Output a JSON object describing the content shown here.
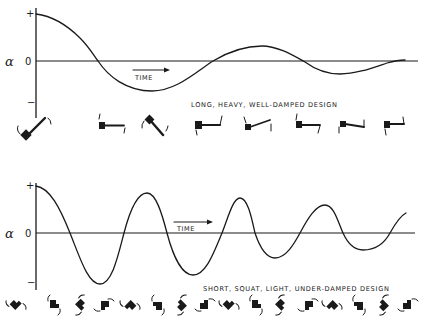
{
  "figure": {
    "panels": [
      {
        "id": "top",
        "y_axis_symbol": "α",
        "y_ticks": [
          "+",
          "0",
          "−"
        ],
        "x_label": "TIME",
        "caption": "LONG, HEAVY, WELL-DAMPED DESIGN",
        "response": "well-damped",
        "oscillation_description": "slow decaying oscillation, ~1.8 cycles visible",
        "pendulum_frame_count": 8,
        "pendulum_style": "long-arm"
      },
      {
        "id": "bottom",
        "y_axis_symbol": "α",
        "y_ticks": [
          "+",
          "0",
          "−"
        ],
        "x_label": "TIME",
        "caption": "SHORT, SQUAT, LIGHT, UNDER-DAMPED DESIGN",
        "response": "under-damped",
        "oscillation_description": "fast lightly decaying oscillation, ~4 cycles visible",
        "pendulum_frame_count": 16,
        "pendulum_style": "short-squat"
      }
    ]
  },
  "chart_data": [
    {
      "type": "line",
      "title": "LONG, HEAVY, WELL-DAMPED DESIGN",
      "xlabel": "TIME",
      "ylabel": "α",
      "y_ticks": [
        "+",
        "0",
        "−"
      ],
      "ylim": [
        -1,
        1
      ],
      "xlim": [
        0,
        1
      ],
      "series": [
        {
          "name": "α(t)",
          "x": [
            0,
            0.08,
            0.16,
            0.24,
            0.31,
            0.38,
            0.46,
            0.53,
            0.6,
            0.67,
            0.72,
            0.78,
            0.84,
            0.91,
            0.96
          ],
          "y": [
            1.0,
            0.82,
            0.45,
            0.0,
            -0.45,
            -0.64,
            -0.45,
            0.0,
            0.3,
            0.32,
            0.0,
            -0.26,
            -0.25,
            -0.05,
            0.02
          ]
        }
      ]
    },
    {
      "type": "line",
      "title": "SHORT, SQUAT, LIGHT, UNDER-DAMPED DESIGN",
      "xlabel": "TIME",
      "ylabel": "α",
      "y_ticks": [
        "+",
        "0",
        "−"
      ],
      "ylim": [
        -1,
        1
      ],
      "xlim": [
        0,
        1
      ],
      "series": [
        {
          "name": "α(t)",
          "x": [
            0,
            0.09,
            0.17,
            0.23,
            0.29,
            0.35,
            0.41,
            0.49,
            0.56,
            0.62,
            0.67,
            0.73,
            0.8,
            0.86,
            0.91,
            0.96,
            1.0
          ],
          "y": [
            1.0,
            0.0,
            -1.08,
            0.0,
            0.85,
            0.0,
            -0.89,
            0.0,
            0.74,
            0.0,
            -0.53,
            0.0,
            0.6,
            0.0,
            -0.36,
            0.0,
            0.43
          ]
        }
      ]
    }
  ]
}
